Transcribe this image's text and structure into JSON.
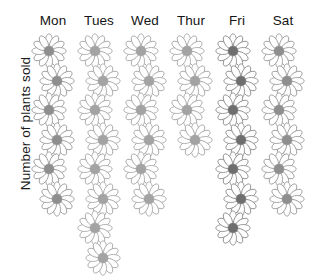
{
  "chart_data": {
    "type": "bar",
    "chart_style": "pictograph",
    "title": "",
    "subtitle": "",
    "xlabel": "",
    "ylabel": "Number of plants sold",
    "categories": [
      "Mon",
      "Tues",
      "Wed",
      "Thur",
      "Fri",
      "Sat"
    ],
    "values": [
      6,
      8,
      6,
      4,
      7,
      6
    ],
    "series": [
      {
        "name": "Plants sold",
        "values": [
          6,
          8,
          6,
          4,
          7,
          6
        ]
      }
    ],
    "icon": "flower-icon",
    "icon_unit_value": 1,
    "ylim": [
      0,
      8
    ],
    "grid": false,
    "legend": false,
    "legend_position": "none",
    "orientation": "vertical",
    "annotations": []
  },
  "axis": {
    "y_label": "Number of plants sold"
  },
  "columns": [
    {
      "label": "Mon",
      "count": 6,
      "petal_fill": "#ffffff",
      "petal_stroke": "#9a9a9a",
      "center": "#8e8e8e"
    },
    {
      "label": "Tues",
      "count": 8,
      "petal_fill": "#ffffff",
      "petal_stroke": "#a6a6a6",
      "center": "#a3a3a3"
    },
    {
      "label": "Wed",
      "count": 6,
      "petal_fill": "#ffffff",
      "petal_stroke": "#a6a6a6",
      "center": "#a3a3a3"
    },
    {
      "label": "Thur",
      "count": 4,
      "petal_fill": "#ffffff",
      "petal_stroke": "#a6a6a6",
      "center": "#a3a3a3"
    },
    {
      "label": "Fri",
      "count": 7,
      "petal_fill": "#ffffff",
      "petal_stroke": "#8c8c8c",
      "center": "#6e6e6e"
    },
    {
      "label": "Sat",
      "count": 6,
      "petal_fill": "#ffffff",
      "petal_stroke": "#9a9a9a",
      "center": "#8e8e8e"
    }
  ],
  "colors": {
    "background": "#ffffff",
    "text": "#141414",
    "petal_outline_light": "#a6a6a6",
    "petal_outline_dark": "#8c8c8c",
    "center_light": "#a3a3a3",
    "center_medium": "#8e8e8e",
    "center_dark": "#6e6e6e"
  }
}
